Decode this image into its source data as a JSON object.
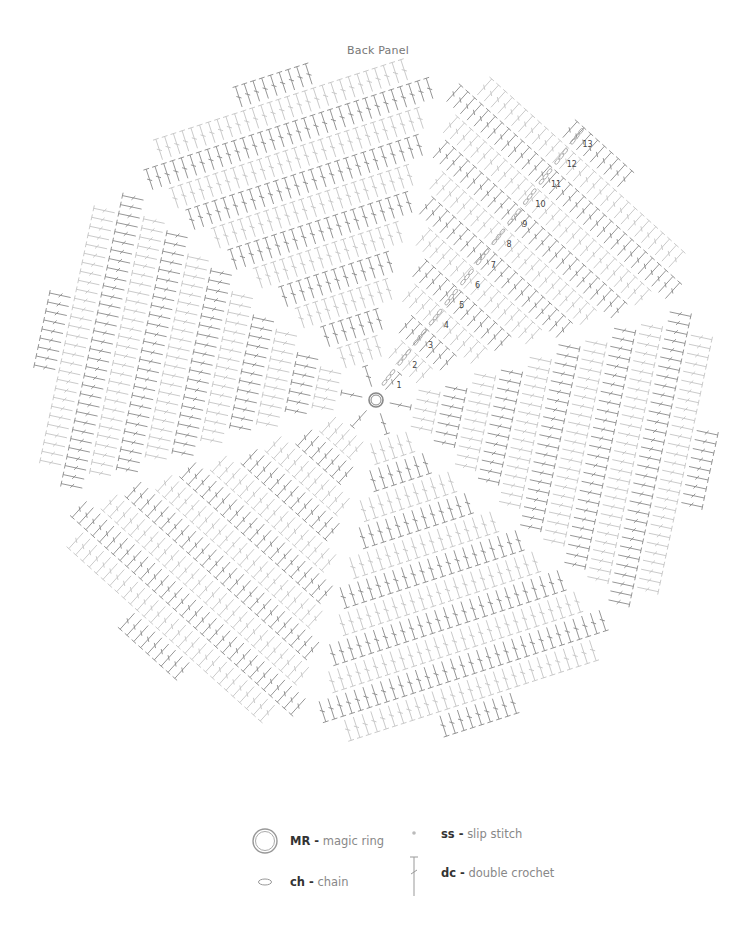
{
  "title": "Back Panel",
  "chart": {
    "center": [
      376,
      400
    ],
    "rounds": 13,
    "round_spacing": 25.5,
    "inner_radius": 12,
    "wedges": 6,
    "wedge_rotation_deg": -18,
    "stitch_gap": 4,
    "colors": {
      "dark": "#8a8a8a",
      "light": "#c4c4c4",
      "chain": "#aaaaaa",
      "ring": "#888888",
      "label": "#444444"
    },
    "round_labels": [
      "1",
      "2",
      "3",
      "4",
      "5",
      "6",
      "7",
      "8",
      "9",
      "10",
      "11",
      "12",
      "13"
    ],
    "label_angle_deg": -52
  },
  "chart_data": {
    "type": "crochet-diagram",
    "title": "Back Panel",
    "rounds": 13,
    "start": "MR - magic ring",
    "stitch": "dc - double crochet",
    "round_start_chain": "ch - chain",
    "round_join": "ss - slip stitch",
    "round_labels": [
      1,
      2,
      3,
      4,
      5,
      6,
      7,
      8,
      9,
      10,
      11,
      12,
      13
    ]
  },
  "legend": {
    "items": [
      {
        "abbr": "MR -",
        "text": "magic ring",
        "symbol": "magic-ring"
      },
      {
        "abbr": "ss -",
        "text": "slip stitch",
        "symbol": "slip-stitch"
      },
      {
        "abbr": "ch -",
        "text": "chain",
        "symbol": "chain"
      },
      {
        "abbr": "dc -",
        "text": "double crochet",
        "symbol": "double-crochet"
      }
    ]
  }
}
